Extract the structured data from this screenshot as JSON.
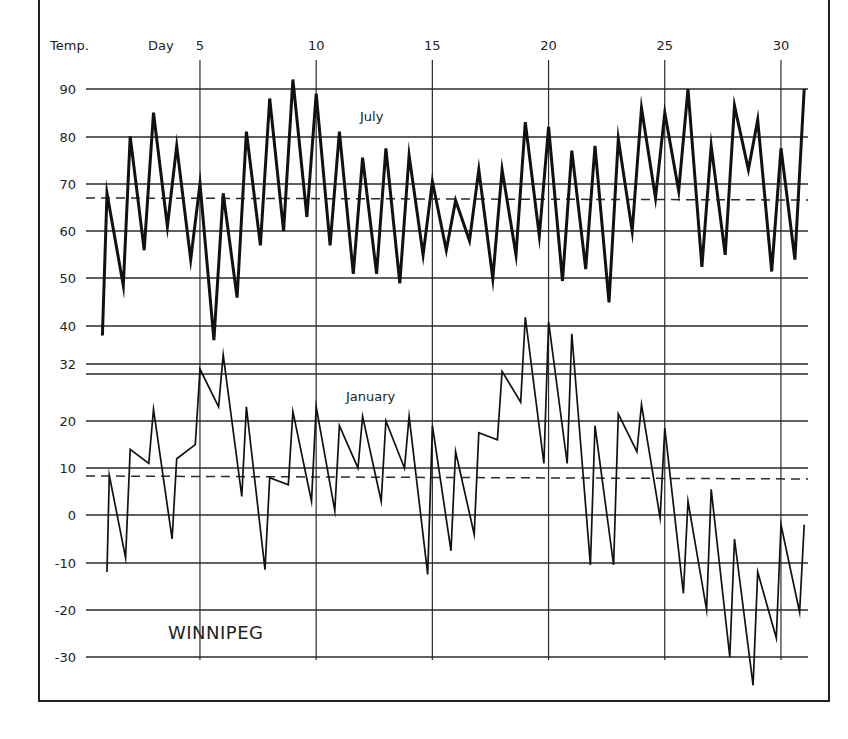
{
  "chart_data": {
    "type": "line",
    "title": "WINNIPEG",
    "xlabel": "Day",
    "ylabel": "Temp.",
    "x_ticks": [
      5,
      10,
      15,
      20,
      25,
      30
    ],
    "y_ticks": [
      90,
      80,
      70,
      60,
      50,
      40,
      32,
      20,
      10,
      0,
      -10,
      -20,
      -30
    ],
    "grid": true,
    "xlim": [
      1,
      31
    ],
    "series": [
      {
        "name": "July",
        "description": "Daily minimum and maximum temperatures (°F), alternating min/max by day",
        "mean_dashed_line": 67,
        "points": [
          [
            0.8,
            38
          ],
          [
            1,
            68
          ],
          [
            1.7,
            48.5
          ],
          [
            2,
            80
          ],
          [
            2.6,
            56
          ],
          [
            3,
            85
          ],
          [
            3.6,
            61
          ],
          [
            4,
            78
          ],
          [
            4.6,
            54
          ],
          [
            5,
            70
          ],
          [
            5.6,
            37
          ],
          [
            6,
            68
          ],
          [
            6.6,
            46
          ],
          [
            7,
            81
          ],
          [
            7.6,
            57
          ],
          [
            8,
            88
          ],
          [
            8.6,
            60
          ],
          [
            9,
            92
          ],
          [
            9.6,
            63
          ],
          [
            10,
            89
          ],
          [
            10.6,
            57
          ],
          [
            11,
            81
          ],
          [
            11.6,
            51
          ],
          [
            12,
            75.5
          ],
          [
            12.6,
            51
          ],
          [
            13,
            77.5
          ],
          [
            13.6,
            49
          ],
          [
            14,
            76
          ],
          [
            14.6,
            55
          ],
          [
            15,
            70.5
          ],
          [
            15.6,
            56
          ],
          [
            16,
            66.5
          ],
          [
            16.6,
            58
          ],
          [
            17,
            73
          ],
          [
            17.6,
            50
          ],
          [
            18,
            73
          ],
          [
            18.6,
            55
          ],
          [
            19,
            83
          ],
          [
            19.6,
            59
          ],
          [
            20,
            82
          ],
          [
            20.6,
            49.5
          ],
          [
            21,
            77
          ],
          [
            21.6,
            52
          ],
          [
            22,
            78
          ],
          [
            22.6,
            45
          ],
          [
            23,
            79.5
          ],
          [
            23.6,
            60
          ],
          [
            24,
            86
          ],
          [
            24.6,
            67
          ],
          [
            25,
            85
          ],
          [
            25.6,
            68.5
          ],
          [
            26,
            90
          ],
          [
            26.6,
            52.5
          ],
          [
            27,
            78
          ],
          [
            27.6,
            55
          ],
          [
            28,
            86.5
          ],
          [
            28.6,
            73
          ],
          [
            29,
            83.5
          ],
          [
            29.6,
            51.5
          ],
          [
            30,
            77.5
          ],
          [
            30.6,
            54
          ],
          [
            31,
            90
          ]
        ]
      },
      {
        "name": "January",
        "description": "Daily minimum and maximum temperatures (°F), alternating min/max by day",
        "mean_dashed_line": 8,
        "points": [
          [
            1,
            -12
          ],
          [
            1.1,
            8.5
          ],
          [
            1.8,
            -9
          ],
          [
            2,
            14
          ],
          [
            2.8,
            11
          ],
          [
            3,
            22.5
          ],
          [
            3.8,
            -5
          ],
          [
            4,
            12
          ],
          [
            4.8,
            15
          ],
          [
            5,
            31
          ],
          [
            5.8,
            23
          ],
          [
            6,
            34
          ],
          [
            6.8,
            4
          ],
          [
            7,
            23
          ],
          [
            7.8,
            -11.5
          ],
          [
            8,
            8
          ],
          [
            8.8,
            6.5
          ],
          [
            9,
            22
          ],
          [
            9.8,
            3
          ],
          [
            10,
            23
          ],
          [
            10.8,
            1
          ],
          [
            11,
            19
          ],
          [
            11.8,
            10
          ],
          [
            12,
            21
          ],
          [
            12.8,
            3
          ],
          [
            13,
            20
          ],
          [
            13.8,
            10
          ],
          [
            14,
            21
          ],
          [
            14.8,
            -12.5
          ],
          [
            15,
            19
          ],
          [
            15.8,
            -7.5
          ],
          [
            16,
            13.5
          ],
          [
            16.8,
            -4
          ],
          [
            17,
            17.5
          ],
          [
            17.8,
            16
          ],
          [
            18,
            30.5
          ],
          [
            18.8,
            24
          ],
          [
            19,
            42
          ],
          [
            19.8,
            11
          ],
          [
            20,
            41
          ],
          [
            20.8,
            11
          ],
          [
            21,
            38.5
          ],
          [
            21.8,
            -10.5
          ],
          [
            22,
            19
          ],
          [
            22.8,
            -10.5
          ],
          [
            23,
            21.5
          ],
          [
            23.8,
            13.5
          ],
          [
            24,
            23.5
          ],
          [
            24.8,
            -0.5
          ],
          [
            25,
            18.5
          ],
          [
            25.8,
            -16.5
          ],
          [
            26,
            3
          ],
          [
            26.8,
            -20
          ],
          [
            27,
            5.5
          ],
          [
            27.8,
            -30
          ],
          [
            28,
            -5
          ],
          [
            28.8,
            -36
          ],
          [
            29,
            -12
          ],
          [
            29.8,
            -26
          ],
          [
            30,
            -2
          ],
          [
            30.8,
            -20.5
          ],
          [
            31,
            -2
          ]
        ]
      }
    ],
    "annotations": [
      "July",
      "January",
      "WINNIPEG"
    ],
    "legend": "none (series labeled inline)"
  },
  "labels": {
    "temp_axis": "Temp.",
    "day_axis": "Day",
    "july": "July",
    "january": "January",
    "station": "WINNIPEG"
  },
  "axes": {
    "x_ticks": [
      {
        "label": "5",
        "day": 5
      },
      {
        "label": "10",
        "day": 10
      },
      {
        "label": "15",
        "day": 15
      },
      {
        "label": "20",
        "day": 20
      },
      {
        "label": "25",
        "day": 25
      },
      {
        "label": "30",
        "day": 30
      }
    ],
    "y_ticks": [
      {
        "label": "90",
        "y": 89
      },
      {
        "label": "80",
        "y": 137
      },
      {
        "label": "70",
        "y": 184
      },
      {
        "label": "60",
        "y": 231
      },
      {
        "label": "50",
        "y": 278
      },
      {
        "label": "40",
        "y": 326
      },
      {
        "label": "32",
        "y": 364
      },
      {
        "label": "20",
        "y": 421
      },
      {
        "label": "10",
        "y": 468
      },
      {
        "label": "0",
        "y": 515
      },
      {
        "label": "-10",
        "y": 563
      },
      {
        "label": "-20",
        "y": 610
      },
      {
        "label": "-30",
        "y": 657
      }
    ],
    "extra_gridlines_y": [
      374
    ]
  },
  "colors": {
    "ink": "#111111",
    "grid": "#2a2a2a",
    "background": "#ffffff"
  }
}
